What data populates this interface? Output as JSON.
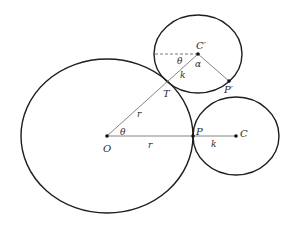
{
  "diagram": {
    "type": "geometry-construction",
    "colors": {
      "circle_stroke": "#1e1e1e",
      "segment_stroke": "#777777",
      "label": "#2a2a2a"
    },
    "labels": {
      "O": "O",
      "P": "P",
      "C": "C",
      "C_prime": "C′",
      "P_prime": "P′",
      "T": "T",
      "theta_origin": "θ",
      "theta_top": "θ",
      "alpha": "α",
      "r_horizontal": "r",
      "r_slanted": "r",
      "k_horizontal": "k",
      "k_slanted": "k"
    },
    "circles": [
      {
        "name": "fixed-circle",
        "center": "O",
        "radius": "r"
      },
      {
        "name": "rolling-circle-initial",
        "center": "C",
        "radius": "k"
      },
      {
        "name": "rolling-circle-rotated",
        "center": "C′",
        "radius": "k"
      }
    ],
    "points": [
      "O",
      "P",
      "C",
      "C′",
      "P′",
      "T"
    ]
  }
}
